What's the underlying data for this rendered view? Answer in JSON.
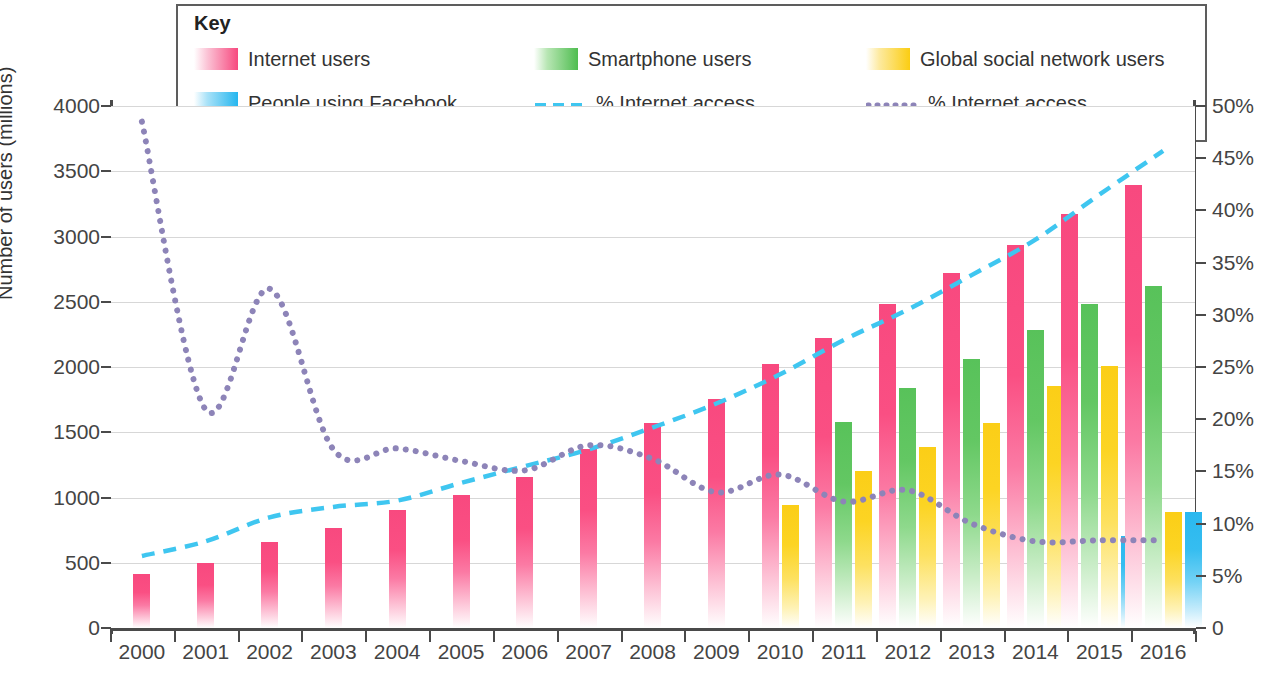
{
  "legend": {
    "title": "Key",
    "items": [
      {
        "name": "internet-users",
        "label": "Internet users",
        "color": "#f7497f",
        "style": "bar"
      },
      {
        "name": "smartphone-users",
        "label": "Smartphone users",
        "color": "#4fbd50",
        "style": "bar"
      },
      {
        "name": "social-network-users",
        "label": "Global social network users",
        "color": "#fbcd12",
        "style": "bar"
      },
      {
        "name": "facebook-news",
        "label": "People using Facebook\nas primary news source",
        "color": "#25b6ef",
        "style": "bar"
      },
      {
        "name": "internet-penetration",
        "label": "% Internet access\npopulation penetration",
        "color": "#3fc6f0",
        "style": "dashed"
      },
      {
        "name": "internet-change",
        "label": "% Internet access\nchange per year",
        "color": "#8d84b8",
        "style": "dotted"
      }
    ]
  },
  "axes": {
    "y_left_title": "Number of users (millions)",
    "y_left_ticks": [
      "0",
      "500",
      "1000",
      "1500",
      "2000",
      "2500",
      "3000",
      "3500",
      "4000"
    ],
    "y_right_ticks": [
      "0",
      "5%",
      "10%",
      "15%",
      "20%",
      "25%",
      "30%",
      "35%",
      "40%",
      "45%",
      "50%"
    ],
    "x_ticks": [
      "2000",
      "2001",
      "2002",
      "2003",
      "2004",
      "2005",
      "2006",
      "2007",
      "2008",
      "2009",
      "2010",
      "2011",
      "2012",
      "2013",
      "2014",
      "2015",
      "2016"
    ]
  },
  "chart_data": {
    "type": "bar",
    "title": "",
    "xlabel": "",
    "ylabel": "Number of users (millions)",
    "ylabel_right": "%",
    "ylim": [
      0,
      4000
    ],
    "ylim_right": [
      0,
      50
    ],
    "grid": true,
    "legend_position": "top",
    "categories": [
      "2000",
      "2001",
      "2002",
      "2003",
      "2004",
      "2005",
      "2006",
      "2007",
      "2008",
      "2009",
      "2010",
      "2011",
      "2012",
      "2013",
      "2014",
      "2015",
      "2016"
    ],
    "series": [
      {
        "name": "Internet users",
        "type": "bar",
        "axis": "left",
        "color": "#f7497f",
        "values": [
          415,
          495,
          660,
          770,
          905,
          1020,
          1155,
          1370,
          1570,
          1755,
          2025,
          2225,
          2480,
          2720,
          2935,
          3175,
          3395
        ]
      },
      {
        "name": "Smartphone users",
        "type": "bar",
        "axis": "left",
        "color": "#4fbd50",
        "values": [
          null,
          null,
          null,
          null,
          null,
          null,
          null,
          null,
          null,
          null,
          null,
          1575,
          1840,
          2060,
          2280,
          2485,
          2620
        ]
      },
      {
        "name": "Global social network users",
        "type": "bar",
        "axis": "left",
        "color": "#fbcd12",
        "values": [
          null,
          null,
          null,
          null,
          null,
          null,
          null,
          null,
          null,
          null,
          945,
          1205,
          1385,
          1570,
          1855,
          2010,
          890
        ]
      },
      {
        "name": "People using Facebook as primary news source",
        "type": "bar",
        "axis": "left",
        "color": "#25b6ef",
        "values": [
          null,
          null,
          null,
          null,
          null,
          null,
          null,
          null,
          null,
          null,
          null,
          null,
          null,
          null,
          null,
          705,
          890
        ]
      },
      {
        "name": "% Internet access population penetration",
        "type": "line",
        "axis": "right",
        "color": "#3fc6f0",
        "dash": "dashed",
        "values": [
          6.9,
          8.3,
          10.6,
          11.6,
          12.2,
          13.9,
          15.5,
          17.1,
          19.2,
          21.5,
          24.3,
          27.6,
          30.5,
          33.8,
          37.2,
          41.5,
          45.7
        ]
      },
      {
        "name": "% Internet access change per year",
        "type": "line",
        "axis": "right",
        "color": "#8d84b8",
        "dash": "dotted",
        "values": [
          48.5,
          20.9,
          32.5,
          17.1,
          17.2,
          16.0,
          15.1,
          17.5,
          16.2,
          13.0,
          14.7,
          12.1,
          13.2,
          10.0,
          8.3,
          8.4,
          8.4
        ]
      }
    ]
  }
}
